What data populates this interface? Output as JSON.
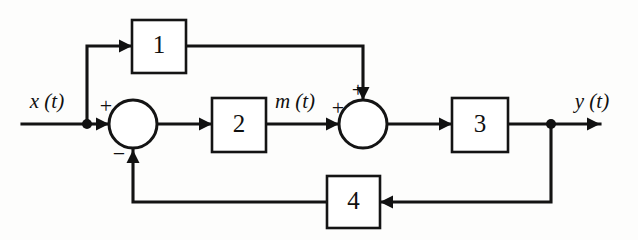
{
  "figure": {
    "kind": "block-diagram",
    "title": "",
    "background_color": "#fdfdfc",
    "line_color": "#131313"
  },
  "blocks": [
    {
      "id": "block-1",
      "label": "1",
      "x": 132,
      "y": 20,
      "w": 54,
      "h": 53
    },
    {
      "id": "block-2",
      "label": "2",
      "x": 212,
      "y": 98,
      "w": 54,
      "h": 54
    },
    {
      "id": "block-3",
      "label": "3",
      "x": 452,
      "y": 98,
      "w": 56,
      "h": 54
    },
    {
      "id": "block-4",
      "label": "4",
      "x": 327,
      "y": 176,
      "w": 53,
      "h": 52
    }
  ],
  "summing_junctions": [
    {
      "id": "summer-1",
      "cx": 133,
      "cy": 124,
      "r": 24,
      "signs": [
        {
          "label": "+",
          "x": 106,
          "y": 108
        },
        {
          "label": "−",
          "x": 119,
          "y": 156
        }
      ]
    },
    {
      "id": "summer-2",
      "cx": 363,
      "cy": 124,
      "r": 24,
      "signs": [
        {
          "label": "+",
          "x": 338,
          "y": 110
        },
        {
          "label": "+",
          "x": 358,
          "y": 92
        }
      ]
    }
  ],
  "signal_labels": [
    {
      "id": "input-signal",
      "label": "x (t)",
      "x": 47,
      "y": 103
    },
    {
      "id": "intermediate-signal",
      "label": "m (t)",
      "x": 295,
      "y": 103
    },
    {
      "id": "output-signal",
      "label": "y (t)",
      "x": 592,
      "y": 103
    }
  ],
  "nodes": [
    {
      "id": "input-tap",
      "cx": 87,
      "cy": 124,
      "r": 5
    },
    {
      "id": "output-tap",
      "cx": 551,
      "cy": 124,
      "r": 5
    }
  ],
  "wires": [
    {
      "id": "wire-input-to-tap",
      "points": "22,124 87,124"
    },
    {
      "id": "wire-tap-to-summer1",
      "points": "87,124 109,124"
    },
    {
      "id": "wire-tap-up-to-block1",
      "points": "87,124 87,46 132,46"
    },
    {
      "id": "wire-block1-to-summer2",
      "points": "186,46 363,46 363,100"
    },
    {
      "id": "wire-summer1-to-block2",
      "points": "157,124 212,124"
    },
    {
      "id": "wire-block2-to-summer2",
      "points": "266,124 339,124"
    },
    {
      "id": "wire-summer2-to-block3",
      "points": "387,124 452,124"
    },
    {
      "id": "wire-block3-to-tap",
      "points": "508,124 551,124"
    },
    {
      "id": "wire-tap-to-output",
      "points": "551,124 600,124"
    },
    {
      "id": "wire-tap-down-to-block4",
      "points": "551,124 551,202 380,202"
    },
    {
      "id": "wire-block4-to-summer1",
      "points": "327,202 133,202 133,150"
    }
  ],
  "arrows": [
    {
      "id": "arrow-into-block1",
      "x": 132,
      "y": 46,
      "dir": "right"
    },
    {
      "id": "arrow-into-summer1-left",
      "x": 109,
      "y": 124,
      "dir": "right"
    },
    {
      "id": "arrow-into-block2",
      "x": 212,
      "y": 124,
      "dir": "right"
    },
    {
      "id": "arrow-into-summer2-left",
      "x": 339,
      "y": 124,
      "dir": "right"
    },
    {
      "id": "arrow-into-block3",
      "x": 452,
      "y": 124,
      "dir": "right"
    },
    {
      "id": "arrow-output",
      "x": 600,
      "y": 124,
      "dir": "right"
    },
    {
      "id": "arrow-into-summer2-top",
      "x": 363,
      "y": 100,
      "dir": "down"
    },
    {
      "id": "arrow-into-summer1-bottom",
      "x": 133,
      "y": 150,
      "dir": "up"
    },
    {
      "id": "arrow-into-block4",
      "x": 380,
      "y": 202,
      "dir": "left"
    }
  ]
}
